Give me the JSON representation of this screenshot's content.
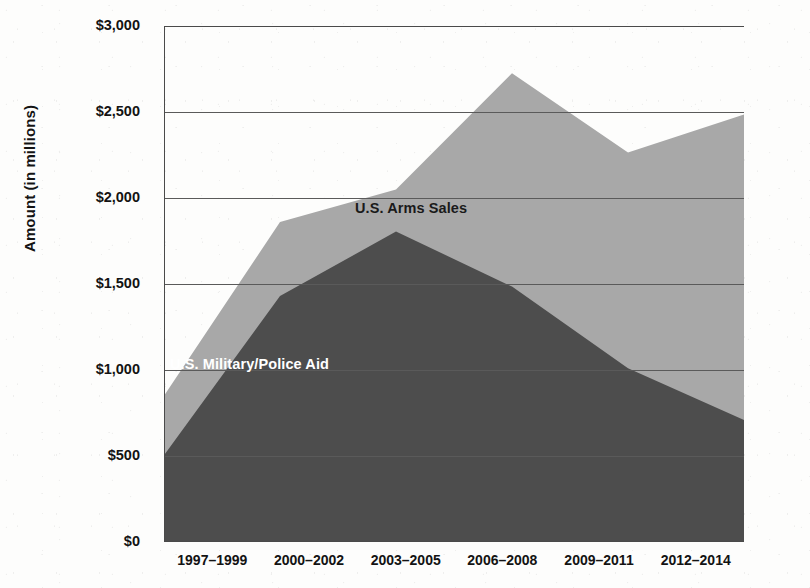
{
  "chart_data": {
    "type": "area",
    "stacked": true,
    "title": "",
    "xlabel": "",
    "ylabel": "Amount (in millions)",
    "categories": [
      "1997–1999",
      "2000–2002",
      "2003–2005",
      "2006–2008",
      "2009–2011",
      "2012–2014"
    ],
    "series": [
      {
        "name": "U.S. Military/Police Aid",
        "color": "#4d4d4d",
        "values": [
          505,
          1430,
          1805,
          1485,
          1010,
          710
        ]
      },
      {
        "name": "U.S. Arms Sales",
        "color": "#a8a8a8",
        "values": [
          345,
          430,
          245,
          1240,
          1255,
          1775
        ]
      }
    ],
    "cumulative_top": [
      850,
      1860,
      2050,
      2725,
      2265,
      2485
    ],
    "ylim": [
      0,
      3000
    ],
    "ytick_values": [
      0,
      500,
      1000,
      1500,
      2000,
      2500,
      3000
    ],
    "ytick_labels": [
      "$0",
      "$500",
      "$1,000",
      "$1,500",
      "$2,000",
      "$2,500",
      "$3,000"
    ],
    "grid": true,
    "legend": "inline-annotations",
    "annotations": [
      {
        "text": "U.S. Arms Sales",
        "color": "#1a1a1a"
      },
      {
        "text": "U.S. Military/Police Aid",
        "color": "#ffffff"
      }
    ]
  },
  "axes": {
    "y_title": "Amount (in millions)",
    "y_ticks": [
      "$3,000",
      "$2,500",
      "$2,000",
      "$1,500",
      "$1,000",
      "$500",
      "$0"
    ],
    "x_ticks": [
      "1997–1999",
      "2000–2002",
      "2003–2005",
      "2006–2008",
      "2009–2011",
      "2012–2014"
    ]
  },
  "labels": {
    "arms_sales": "U.S. Arms Sales",
    "military_police_aid": "U.S. Military/Police Aid"
  },
  "colors": {
    "arms_sales_fill": "#a8a8a8",
    "aid_fill": "#4d4d4d",
    "axis": "#4a4a4a",
    "grid": "#5a5a5a",
    "text": "#131313",
    "background": "#fdfdfc"
  }
}
